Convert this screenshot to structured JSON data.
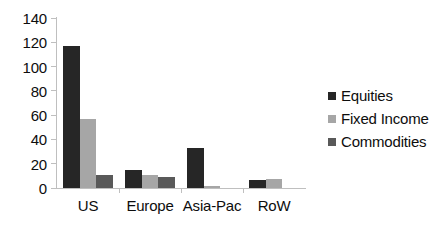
{
  "chart_data": {
    "type": "bar",
    "title": "",
    "xlabel": "",
    "ylabel": "",
    "categories": [
      "US",
      "Europe",
      "Asia-Pac",
      "RoW"
    ],
    "series": [
      {
        "name": "Equities",
        "color": "#262626",
        "values": [
          117,
          15,
          33,
          7
        ]
      },
      {
        "name": "Fixed Income",
        "color": "#a6a6a6",
        "values": [
          57,
          11,
          1.5,
          7.5
        ]
      },
      {
        "name": "Commodities",
        "color": "#595959",
        "values": [
          11,
          9,
          0,
          0
        ]
      }
    ],
    "ylim": [
      0,
      140
    ],
    "yticks": [
      0,
      20,
      40,
      60,
      80,
      100,
      120,
      140
    ],
    "ytick_labels": [
      "0",
      "20",
      "40",
      "60",
      "80",
      "100",
      "120",
      "140"
    ],
    "grid": false,
    "legend_position": "right",
    "axis_color": "#bfbfbf",
    "text_color": "#0d0d0d",
    "background": "#ffffff"
  }
}
